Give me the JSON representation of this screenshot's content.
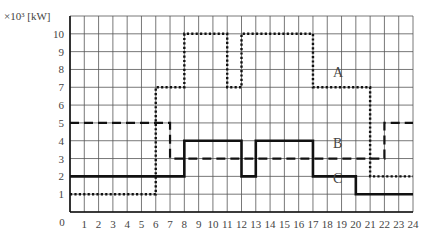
{
  "chart_data": {
    "type": "line",
    "step": true,
    "title": "",
    "xlabel": "",
    "ylabel": "×10³ [kW]",
    "xlim": [
      0,
      24
    ],
    "ylim": [
      0,
      11
    ],
    "grid": true,
    "x_ticks": [
      0,
      1,
      2,
      3,
      4,
      5,
      6,
      7,
      8,
      9,
      10,
      11,
      12,
      13,
      14,
      15,
      16,
      17,
      18,
      19,
      20,
      21,
      22,
      23,
      24
    ],
    "y_ticks": [
      1,
      2,
      3,
      4,
      5,
      6,
      7,
      8,
      9,
      10
    ],
    "origin_label": "0",
    "series": [
      {
        "name": "A",
        "style": "dotted",
        "segments": [
          {
            "from": 0,
            "to": 6,
            "value": 1
          },
          {
            "from": 6,
            "to": 8,
            "value": 7
          },
          {
            "from": 8,
            "to": 11,
            "value": 10
          },
          {
            "from": 11,
            "to": 12,
            "value": 7
          },
          {
            "from": 12,
            "to": 17,
            "value": 10
          },
          {
            "from": 17,
            "to": 21,
            "value": 7
          },
          {
            "from": 21,
            "to": 24,
            "value": 2
          }
        ],
        "label_pos": {
          "x": 18.4,
          "y": 7.6
        }
      },
      {
        "name": "B",
        "style": "dashed",
        "segments": [
          {
            "from": 0,
            "to": 7,
            "value": 5
          },
          {
            "from": 7,
            "to": 22,
            "value": 3
          },
          {
            "from": 22,
            "to": 24,
            "value": 5
          }
        ],
        "label_pos": {
          "x": 18.4,
          "y": 3.6
        }
      },
      {
        "name": "C",
        "style": "solid",
        "segments": [
          {
            "from": 0,
            "to": 8,
            "value": 2
          },
          {
            "from": 8,
            "to": 12,
            "value": 4
          },
          {
            "from": 12,
            "to": 13,
            "value": 2
          },
          {
            "from": 13,
            "to": 17,
            "value": 4
          },
          {
            "from": 17,
            "to": 20,
            "value": 2
          },
          {
            "from": 20,
            "to": 24,
            "value": 1
          }
        ],
        "label_pos": {
          "x": 18.4,
          "y": 1.6
        }
      }
    ]
  }
}
